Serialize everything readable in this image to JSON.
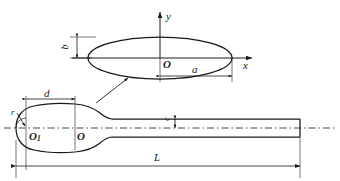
{
  "figure": {
    "line_color": "#1a1a1a",
    "background": "#ffffff"
  },
  "top_view": {
    "name": "elliptical cross-section",
    "origin_label": "O",
    "axis_x_label": "x",
    "axis_y_label": "y",
    "semi_major_label": "a",
    "semi_minor_label": "b"
  },
  "side_view": {
    "name": "streamlined body profile",
    "origin_label": "O",
    "nose_origin_label": "O",
    "nose_origin_sub": "1",
    "nose_radius_label": "r",
    "nose_offset_label": "d",
    "total_length_label": "L",
    "shaft_height_label": "c"
  }
}
